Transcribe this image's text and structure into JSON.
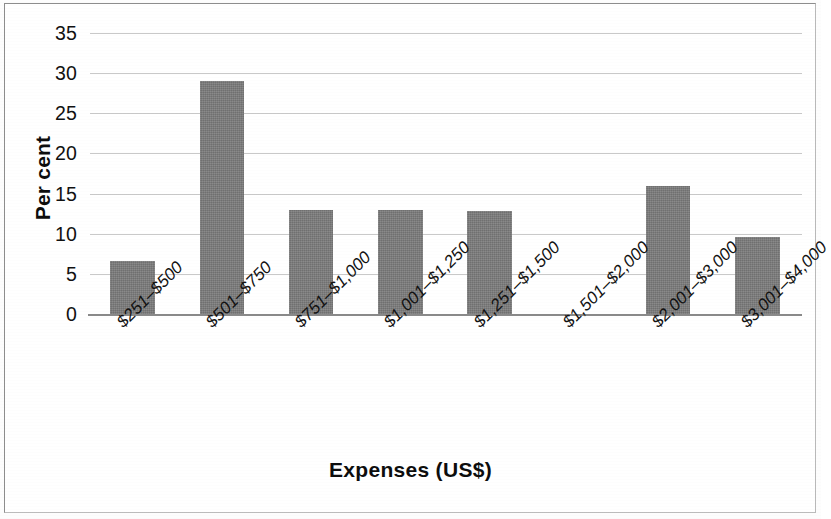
{
  "chart_data": {
    "type": "bar",
    "title": "",
    "subtitle": "",
    "xlabel": "Expenses (US$)",
    "ylabel": "Per cent",
    "categories": [
      "$251–$500",
      "$501–$750",
      "$751–$1,000",
      "$1,001–$1,250",
      "$1,251–$1,500",
      "$1,501–$2,000",
      "$2,001–$3,000",
      "$3,001–$4,000"
    ],
    "values": [
      6.6,
      29.0,
      13.0,
      13.0,
      12.8,
      0,
      16.0,
      9.6
    ],
    "ylim": [
      0,
      35
    ],
    "yticks": [
      0,
      5,
      10,
      15,
      20,
      25,
      30,
      35
    ],
    "ytick_labels": [
      "0",
      "5",
      "10",
      "15",
      "20",
      "25",
      "30",
      "35"
    ],
    "grid": "horizontal",
    "legend": "none",
    "bar_color": "#7c7c7c",
    "gridline_color": "#c9c9c9",
    "axis_color": "#8a8a8a",
    "annotations": []
  },
  "figure": {
    "border_color": "#8d8d8d",
    "background": "#ffffff"
  }
}
